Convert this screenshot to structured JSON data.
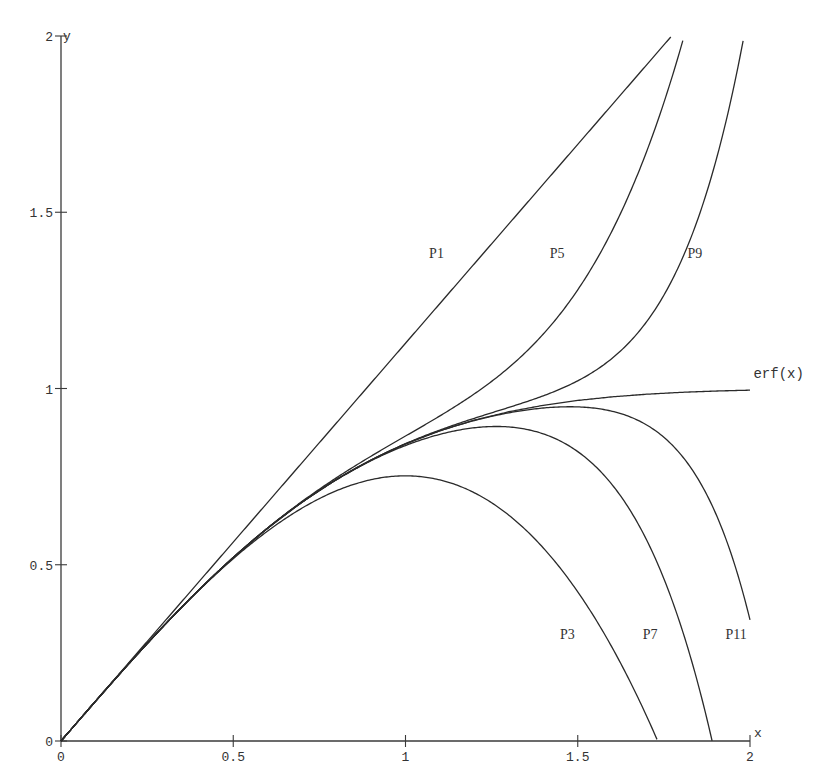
{
  "chart_data": {
    "type": "line",
    "title": "",
    "xlabel": "x",
    "ylabel": "y",
    "xlim": [
      0,
      2
    ],
    "ylim": [
      0,
      2
    ],
    "grid": false,
    "legend": "inline labels",
    "x_ticks": [
      {
        "value": 0,
        "label": "0"
      },
      {
        "value": 0.5,
        "label": "0.5"
      },
      {
        "value": 1,
        "label": "1"
      },
      {
        "value": 1.5,
        "label": "1.5"
      },
      {
        "value": 2,
        "label": "2"
      }
    ],
    "y_ticks": [
      {
        "value": 0,
        "label": "0"
      },
      {
        "value": 0.5,
        "label": "0.5"
      },
      {
        "value": 1,
        "label": "1"
      },
      {
        "value": 1.5,
        "label": "1.5"
      },
      {
        "value": 2,
        "label": "2"
      }
    ],
    "x": [
      0,
      0.1,
      0.2,
      0.3,
      0.4,
      0.5,
      0.6,
      0.7,
      0.8,
      0.9,
      1.0,
      1.1,
      1.2,
      1.3,
      1.4,
      1.5,
      1.6,
      1.7,
      1.8,
      1.9,
      2.0
    ],
    "series": [
      {
        "name": "P1",
        "label": "P1",
        "label_pos": [
          1.09,
          1.37
        ],
        "values": [
          0,
          0.11284,
          0.22568,
          0.33851,
          0.45135,
          0.56419,
          0.67703,
          0.78987,
          0.9027,
          1.01554,
          1.12838,
          1.24122,
          1.35406,
          1.46689,
          1.57973,
          1.69257,
          1.80541,
          1.91824,
          2.03108,
          2.14392,
          2.25676
        ]
      },
      {
        "name": "P3",
        "label": "P3",
        "label_pos": [
          1.47,
          0.29
        ],
        "values": [
          0,
          0.11246,
          0.22267,
          0.32836,
          0.42728,
          0.51717,
          0.59578,
          0.66085,
          0.71013,
          0.74135,
          0.75225,
          0.74059,
          0.7041,
          0.64055,
          0.54766,
          0.42314,
          0.26477,
          0.07036,
          -0.16246,
          -0.43596,
          -0.75225
        ]
      },
      {
        "name": "P5",
        "label": "P5",
        "label_pos": [
          1.44,
          1.37
        ],
        "values": [
          0,
          0.11246,
          0.2227,
          0.32863,
          0.42844,
          0.5207,
          0.60455,
          0.67982,
          0.74711,
          0.80798,
          0.86509,
          0.92232,
          0.98488,
          1.05951,
          1.15453,
          1.28001,
          1.44796,
          1.67251,
          1.9697,
          2.35807,
          2.85843
        ]
      },
      {
        "name": "P7",
        "label": "P7",
        "label_pos": [
          1.71,
          0.29
        ],
        "values": [
          0,
          0.11246,
          0.2227,
          0.32863,
          0.42839,
          0.52049,
          0.6038,
          0.67761,
          0.74147,
          0.79513,
          0.83822,
          0.86997,
          0.88862,
          0.89093,
          0.87132,
          0.82098,
          0.72678,
          0.56008,
          0.3249,
          -0.04344,
          -0.58046
        ]
      },
      {
        "name": "P9",
        "label": "P9",
        "label_pos": [
          1.84,
          1.37
        ],
        "values": [
          0,
          0.11246,
          0.2227,
          0.32863,
          0.42839,
          0.5205,
          0.60386,
          0.67782,
          0.74217,
          0.79715,
          0.84345,
          0.88229,
          0.91557,
          0.94633,
          0.97925,
          1.02181,
          1.08577,
          1.17958,
          1.3611,
          1.64225,
          2.09422
        ]
      },
      {
        "name": "P11",
        "label": "P11",
        "label_pos": [
          1.96,
          0.29
        ],
        "values": [
          0,
          0.11246,
          0.2227,
          0.32863,
          0.42839,
          0.5205,
          0.60386,
          0.6778,
          0.7421,
          0.79688,
          0.8426,
          0.87985,
          0.90922,
          0.93101,
          0.94463,
          0.94787,
          0.93539,
          0.88661,
          0.81171,
          0.64647,
          0.34354
        ]
      },
      {
        "name": "erf(x)",
        "label": "erf(x)",
        "label_pos": [
          2.01,
          1.03
        ],
        "values": [
          0,
          0.11246,
          0.2227,
          0.32863,
          0.42839,
          0.5205,
          0.60386,
          0.6778,
          0.7421,
          0.79691,
          0.8427,
          0.88021,
          0.91031,
          0.93401,
          0.95229,
          0.96611,
          0.97635,
          0.98379,
          0.98909,
          0.99279,
          0.99532
        ]
      }
    ],
    "taylor_coefficients": {
      "scale": 1.1283792,
      "terms": [
        {
          "power": 1,
          "coef": 1
        },
        {
          "power": 3,
          "coef": -0.3333333
        },
        {
          "power": 5,
          "coef": 0.1
        },
        {
          "power": 7,
          "coef": -0.0238095
        },
        {
          "power": 9,
          "coef": 0.0046296
        },
        {
          "power": 11,
          "coef": -0.0007576
        }
      ]
    }
  },
  "axes": {
    "x_axis_label": "x",
    "y_axis_label": "y"
  },
  "plot_area": {
    "x0_px": 61,
    "x2_px": 750,
    "y0_px": 741,
    "y2_px": 36
  }
}
